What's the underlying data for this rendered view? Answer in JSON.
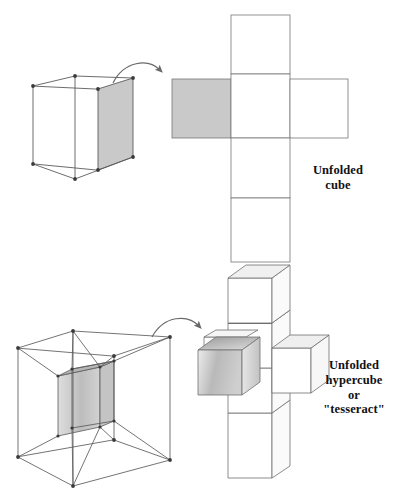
{
  "figure": {
    "background_color": "#ffffff",
    "ink_color": "#555555",
    "shade_color": "#c8c8c8",
    "text_color": "#111111"
  },
  "captions": {
    "unfolded_cube": {
      "lines": [
        "Unfolded",
        "cube"
      ],
      "line1": "Unfolded",
      "line2": "cube"
    },
    "unfolded_hypercube": {
      "lines": [
        "Unfolded",
        "hypercube",
        "or",
        "\"tesseract\""
      ],
      "line1": "Unfolded",
      "line2": "hypercube",
      "line3": "or",
      "line4": "\"tesseract\""
    }
  },
  "panels": {
    "top": {
      "name": "cube-unfolding",
      "source_shape": "wireframe-cube",
      "target_shape": "cube-net-cross",
      "shaded_face_count": 1,
      "net_face_count": 6,
      "arrow": "curved-arrow-right"
    },
    "bottom": {
      "name": "hypercube-unfolding",
      "source_shape": "tesseract-wireframe-nested-cube",
      "target_shape": "hypercube-net-cross",
      "shaded_cell_count": 1,
      "net_cell_count": 8,
      "arrow": "curved-arrow-right"
    }
  },
  "geometry": {
    "cube_net": {
      "cell_size": 59,
      "origin_x": 231,
      "origin_y": 15,
      "shaded_cell": {
        "x": 172,
        "y": 79,
        "w": 59,
        "h": 59
      },
      "column_x": 231,
      "rows": [
        15,
        74,
        133,
        198,
        262
      ]
    },
    "hypercube_net": {
      "cell_size": 45,
      "origin_x": 228,
      "origin_y": 318
    }
  }
}
